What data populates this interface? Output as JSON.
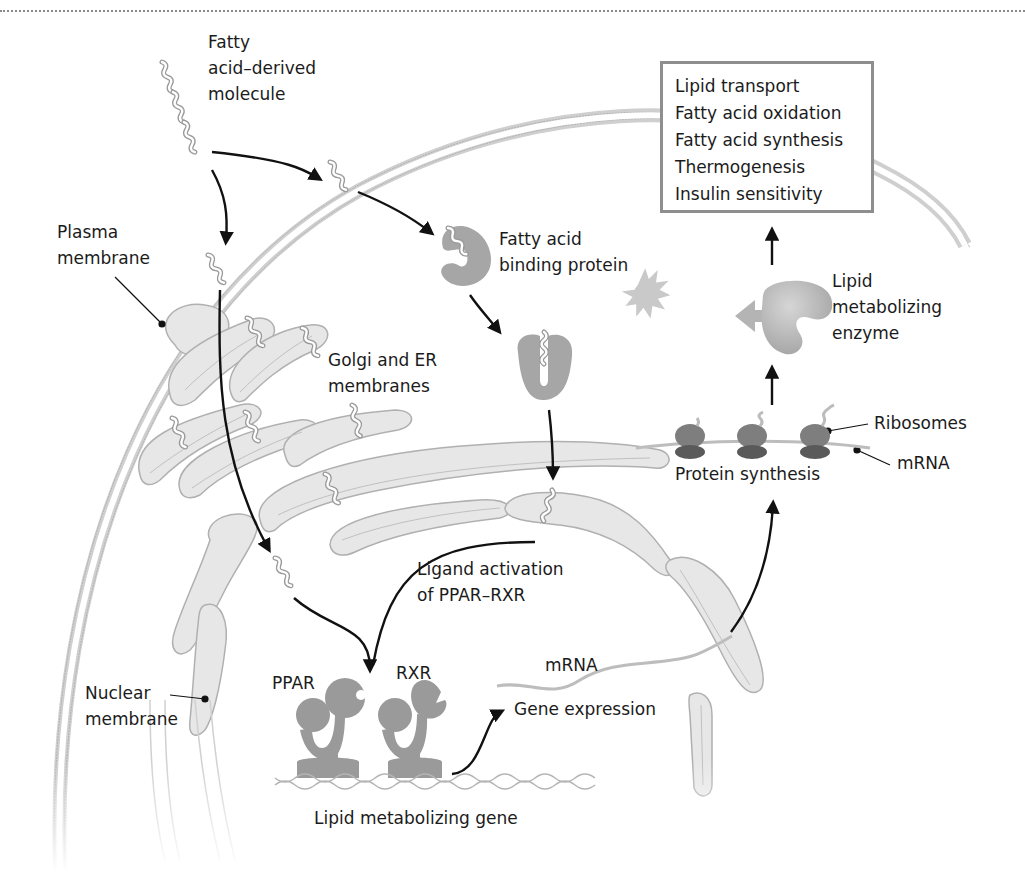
{
  "figure": {
    "colors": {
      "membrane": "#c9c9c9",
      "membrane_line": "#a8a8a8",
      "protein": "#9d9d9d",
      "ribosome_top": "#7a7a7a",
      "ribosome_bottom": "#5a5a5a",
      "arrow": "#111111",
      "box_border": "#8e8e8e"
    }
  },
  "labels": {
    "fatty_acid_molecule": [
      "Fatty",
      "acid–derived",
      "molecule"
    ],
    "plasma_membrane": [
      "Plasma",
      "membrane"
    ],
    "golgi_er": [
      "Golgi and ER",
      "membranes"
    ],
    "fabp": [
      "Fatty acid",
      "binding protein"
    ],
    "ligand_activation": [
      "Ligand activation",
      "of PPAR–RXR"
    ],
    "nuclear_membrane": [
      "Nuclear",
      "membrane"
    ],
    "ppar": "PPAR",
    "rxr": "RXR",
    "lipid_gene": "Lipid metabolizing gene",
    "mrna_nucleus": "mRNA",
    "gene_expression": "Gene expression",
    "protein_synthesis": "Protein synthesis",
    "ribosomes": "Ribosomes",
    "mrna_cytoplasm": "mRNA",
    "enzyme": [
      "Lipid",
      "metabolizing",
      "enzyme"
    ]
  },
  "outcomes": {
    "items": [
      "Lipid transport",
      "Fatty acid oxidation",
      "Fatty acid synthesis",
      "Thermogenesis",
      "Insulin sensitivity"
    ]
  }
}
